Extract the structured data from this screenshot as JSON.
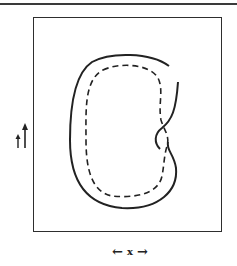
{
  "figure": {
    "type": "kidney-shaped region with inner dashed contour inside rectangular domain",
    "x_axis": {
      "label": "x",
      "left_arrow": "←",
      "right_arrow": "→"
    },
    "y_axis": {
      "label": "↑",
      "arrow": "↑"
    },
    "outer_curve": {
      "style": "solid",
      "color": "#222222"
    },
    "inner_curve": {
      "style": "dashed",
      "color": "#222222"
    },
    "frame": {
      "color": "#2e2e2e"
    }
  }
}
